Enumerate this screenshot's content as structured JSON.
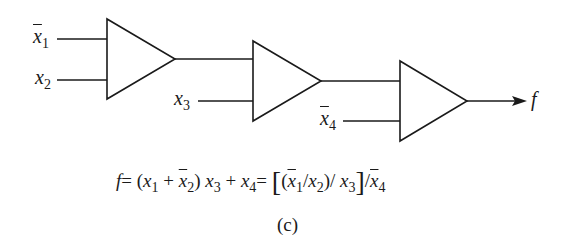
{
  "diagram": {
    "inputs": {
      "x1bar": {
        "base": "x",
        "sub": "1",
        "bar": true
      },
      "x2": {
        "base": "x",
        "sub": "2",
        "bar": false
      },
      "x3": {
        "base": "x",
        "sub": "3",
        "bar": false
      },
      "x4bar": {
        "base": "x",
        "sub": "4",
        "bar": true
      }
    },
    "output": {
      "label": "f"
    },
    "gates": [
      {
        "id": "gate-1",
        "inputs": [
          "x̄1",
          "x2"
        ],
        "shape": "triangle"
      },
      {
        "id": "gate-2",
        "inputs": [
          "gate-1",
          "x3"
        ],
        "shape": "triangle"
      },
      {
        "id": "gate-3",
        "inputs": [
          "gate-2",
          "x̄4"
        ],
        "shape": "triangle"
      }
    ],
    "line_color": "#1a1a1a"
  },
  "equation": {
    "f": "f",
    "eq1": "=",
    "lp1": "(",
    "x": "x",
    "s1": "1",
    "plus": " + ",
    "s2": "2",
    "rp1": ")",
    "s3": "3",
    "plus2": " + ",
    "s4": "4",
    "eq2": "=",
    "lbr": "[",
    "lp2": "(",
    "slash": "/",
    "rp2": ")",
    "slash2": "/ ",
    "rbr": "]",
    "slash3": "/",
    "text": "f = (x1 + x̄2) x3 + x4 = [(x̄1/x2)/ x3]/x̄4"
  },
  "caption": "(c)"
}
